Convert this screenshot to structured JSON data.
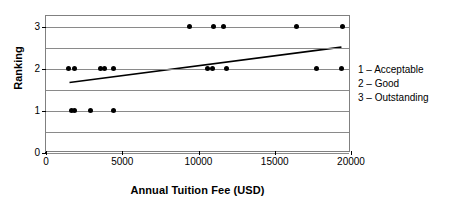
{
  "chart_data": {
    "type": "scatter",
    "title": "",
    "xlabel": "Annual Tuition Fee (USD)",
    "ylabel": "Ranking",
    "xlim": [
      0,
      20000
    ],
    "ylim": [
      0,
      3.25
    ],
    "xticks": [
      0,
      5000,
      10000,
      15000,
      20000
    ],
    "xtick_labels": [
      "0",
      "5000",
      "10000",
      "15000",
      "20000"
    ],
    "yticks": [
      0,
      1,
      2,
      3
    ],
    "ytick_labels": [
      "0",
      "1",
      "2",
      "3"
    ],
    "gridlines_y": [
      0,
      0.5,
      1,
      1.5,
      2,
      2.5,
      3
    ],
    "grid": true,
    "legend_position": "right-outside",
    "series": [
      {
        "name": "Institutions",
        "marker": "filled-diamond",
        "color": "#000000",
        "points": [
          {
            "x": 1650,
            "y": 1
          },
          {
            "x": 1900,
            "y": 1
          },
          {
            "x": 2950,
            "y": 1
          },
          {
            "x": 4450,
            "y": 1
          },
          {
            "x": 1450,
            "y": 2
          },
          {
            "x": 1850,
            "y": 2
          },
          {
            "x": 3550,
            "y": 2
          },
          {
            "x": 3850,
            "y": 2
          },
          {
            "x": 4450,
            "y": 2
          },
          {
            "x": 10600,
            "y": 2
          },
          {
            "x": 10900,
            "y": 2
          },
          {
            "x": 11850,
            "y": 2
          },
          {
            "x": 17750,
            "y": 2
          },
          {
            "x": 19400,
            "y": 2
          },
          {
            "x": 9400,
            "y": 3
          },
          {
            "x": 11000,
            "y": 3
          },
          {
            "x": 11650,
            "y": 3
          },
          {
            "x": 16450,
            "y": 3
          },
          {
            "x": 19450,
            "y": 3
          }
        ]
      }
    ],
    "trendline": {
      "name": "Linear trend",
      "color": "#000000",
      "x_start": 1550,
      "y_start": 1.65,
      "x_end": 19500,
      "y_end": 2.5
    }
  },
  "legend": {
    "entries": [
      "1 – Acceptable",
      "2 – Good",
      "3 – Outstanding"
    ]
  },
  "colors": {
    "marker": "#000000",
    "grid": "#8a8a8a",
    "frame": "#808080",
    "axis": "#000000",
    "background": "#ffffff"
  }
}
